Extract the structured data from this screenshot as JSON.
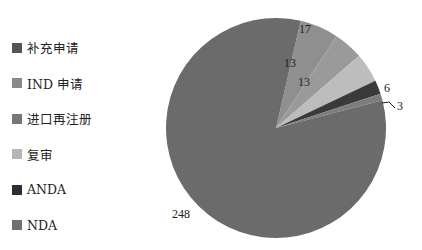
{
  "chart_data": {
    "type": "pie",
    "title": "",
    "categories": [
      "补充申请",
      "IND 申请",
      "进口再注册",
      "复审",
      "ANDA",
      "NDA"
    ],
    "values": [
      248,
      17,
      13,
      13,
      6,
      3
    ],
    "colors": [
      "#6b6b6b",
      "#8f8f8f",
      "#9a9a9a",
      "#bdbdbd",
      "#3a3a3a",
      "#7d7d7d"
    ],
    "legend_position": "left",
    "data_labels": [
      "248",
      "17",
      "13",
      "13",
      "6",
      "3"
    ]
  },
  "legend": {
    "items": [
      {
        "label": "补充申请",
        "color": "#555555"
      },
      {
        "label": "IND 申请",
        "color": "#8a8a8a"
      },
      {
        "label": "进口再注册",
        "color": "#777777"
      },
      {
        "label": "复审",
        "color": "#b5b5b5"
      },
      {
        "label": "ANDA",
        "color": "#2e2e2e"
      },
      {
        "label": "NDA",
        "color": "#707070"
      }
    ]
  }
}
